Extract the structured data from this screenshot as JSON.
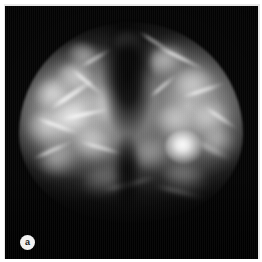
{
  "figure": {
    "kind": "medical-radiograph",
    "modality": "mammogram",
    "panel_label": "a",
    "frame_color": "#e9e9e9",
    "film_background_color": "#050505",
    "tissue_highlight_color": "#d6d6d6",
    "lesion_color": "#ffffff"
  },
  "anatomy": {
    "tissue_mass_name": "breast-tissue",
    "central_cleft_name": "retroareolar-cleft",
    "lesion_name": "bright-mass-lesion"
  },
  "glands": [
    {
      "left": 30,
      "top": 72,
      "w": 40,
      "h": 34,
      "bright": 0.66,
      "blur": 3.4,
      "rot": -16
    },
    {
      "left": 22,
      "top": 104,
      "w": 46,
      "h": 38,
      "bright": 0.6,
      "blur": 3.8,
      "rot": 8
    },
    {
      "left": 52,
      "top": 58,
      "w": 38,
      "h": 30,
      "bright": 0.62,
      "blur": 3.2,
      "rot": 22
    },
    {
      "left": 46,
      "top": 96,
      "w": 44,
      "h": 36,
      "bright": 0.72,
      "blur": 3.0,
      "rot": -8
    },
    {
      "left": 68,
      "top": 122,
      "w": 42,
      "h": 34,
      "bright": 0.55,
      "blur": 3.6,
      "rot": 14
    },
    {
      "left": 34,
      "top": 138,
      "w": 40,
      "h": 32,
      "bright": 0.48,
      "blur": 4.0,
      "rot": -22
    },
    {
      "left": 62,
      "top": 38,
      "w": 34,
      "h": 26,
      "bright": 0.5,
      "blur": 3.4,
      "rot": 30
    },
    {
      "left": 88,
      "top": 80,
      "w": 30,
      "h": 40,
      "bright": 0.44,
      "blur": 3.8,
      "rot": 6
    },
    {
      "left": 142,
      "top": 40,
      "w": 40,
      "h": 30,
      "bright": 0.58,
      "blur": 3.2,
      "rot": -18
    },
    {
      "left": 168,
      "top": 62,
      "w": 44,
      "h": 36,
      "bright": 0.56,
      "blur": 3.6,
      "rot": 10
    },
    {
      "left": 186,
      "top": 96,
      "w": 42,
      "h": 36,
      "bright": 0.52,
      "blur": 3.8,
      "rot": -12
    },
    {
      "left": 150,
      "top": 100,
      "w": 40,
      "h": 34,
      "bright": 0.5,
      "blur": 3.4,
      "rot": 18
    },
    {
      "left": 196,
      "top": 122,
      "w": 36,
      "h": 30,
      "bright": 0.46,
      "blur": 3.8,
      "rot": 4
    },
    {
      "left": 128,
      "top": 132,
      "w": 38,
      "h": 32,
      "bright": 0.42,
      "blur": 4.0,
      "rot": -26
    },
    {
      "left": 158,
      "top": 158,
      "w": 44,
      "h": 30,
      "bright": 0.34,
      "blur": 4.4,
      "rot": 12
    },
    {
      "left": 78,
      "top": 160,
      "w": 48,
      "h": 30,
      "bright": 0.32,
      "blur": 4.4,
      "rot": -10
    },
    {
      "left": 110,
      "top": 26,
      "w": 26,
      "h": 22,
      "bright": 0.4,
      "blur": 3.0,
      "rot": 0
    },
    {
      "left": 124,
      "top": 62,
      "w": 26,
      "h": 34,
      "bright": 0.38,
      "blur": 3.6,
      "rot": -6
    }
  ],
  "strands": [
    {
      "left": 40,
      "top": 86,
      "w": 54,
      "h": 5,
      "bright": 0.8,
      "blur": 1.5,
      "rot": -34
    },
    {
      "left": 30,
      "top": 118,
      "w": 46,
      "h": 4,
      "bright": 0.72,
      "blur": 1.6,
      "rot": 20
    },
    {
      "left": 56,
      "top": 106,
      "w": 50,
      "h": 4,
      "bright": 0.78,
      "blur": 1.4,
      "rot": -12
    },
    {
      "left": 62,
      "top": 74,
      "w": 40,
      "h": 4,
      "bright": 0.7,
      "blur": 1.6,
      "rot": 40
    },
    {
      "left": 26,
      "top": 142,
      "w": 44,
      "h": 4,
      "bright": 0.58,
      "blur": 1.8,
      "rot": -24
    },
    {
      "left": 74,
      "top": 140,
      "w": 46,
      "h": 4,
      "bright": 0.56,
      "blur": 1.8,
      "rot": 16
    },
    {
      "left": 150,
      "top": 50,
      "w": 52,
      "h": 4,
      "bright": 0.72,
      "blur": 1.6,
      "rot": 26
    },
    {
      "left": 176,
      "top": 82,
      "w": 46,
      "h": 4,
      "bright": 0.66,
      "blur": 1.7,
      "rot": -18
    },
    {
      "left": 196,
      "top": 110,
      "w": 40,
      "h": 4,
      "bright": 0.6,
      "blur": 1.8,
      "rot": 34
    },
    {
      "left": 140,
      "top": 78,
      "w": 36,
      "h": 4,
      "bright": 0.58,
      "blur": 1.8,
      "rot": -40
    },
    {
      "left": 186,
      "top": 142,
      "w": 44,
      "h": 4,
      "bright": 0.46,
      "blur": 2.0,
      "rot": 28
    },
    {
      "left": 96,
      "top": 176,
      "w": 58,
      "h": 4,
      "bright": 0.4,
      "blur": 2.2,
      "rot": -14
    },
    {
      "left": 148,
      "top": 184,
      "w": 54,
      "h": 4,
      "bright": 0.36,
      "blur": 2.2,
      "rot": 14
    },
    {
      "left": 130,
      "top": 34,
      "w": 40,
      "h": 4,
      "bright": 0.52,
      "blur": 1.8,
      "rot": 32
    },
    {
      "left": 72,
      "top": 50,
      "w": 38,
      "h": 4,
      "bright": 0.5,
      "blur": 1.8,
      "rot": -30
    }
  ],
  "lesion": {
    "left": 160,
    "top": 124,
    "w": 38,
    "h": 34
  },
  "cleft": {
    "left": 96,
    "top": 18,
    "w": 54,
    "h": 130
  },
  "cleft_tail": {
    "left": 108,
    "top": 130,
    "w": 28,
    "h": 86
  }
}
